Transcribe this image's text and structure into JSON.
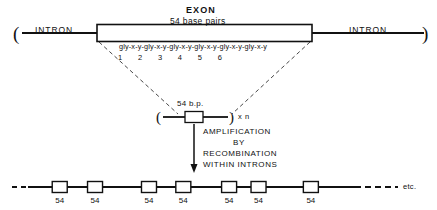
{
  "figure": {
    "top_row": {
      "left_intron_label": "INTRON",
      "right_intron_label": "INTRON",
      "exon_title": "EXON",
      "exon_subtitle": "54 base pairs",
      "left_paren": "(",
      "right_paren": ")"
    },
    "sequence": {
      "text": "gly-x-y-gly-x-y-gly-x-y-gly-x-y-gly-x-y-gly-x-y",
      "repeat_unit": "gly-x-y",
      "repeat_count": 6,
      "numbers": [
        "1",
        "2",
        "3",
        "4",
        "5",
        "6"
      ]
    },
    "unit": {
      "size_label": "54 b.p.",
      "left_paren": "(",
      "right_paren": ")",
      "multiplier": "x n"
    },
    "process": {
      "line1": "AMPLIFICATION",
      "line2": "BY",
      "line3": "RECOMBINATION",
      "line4": "WITHIN INTRONS"
    },
    "bottom_row": {
      "box_labels": [
        "54",
        "54",
        "54",
        "54",
        "54",
        "54",
        "54"
      ],
      "box_x": [
        97,
        205,
        370,
        475,
        615,
        705,
        865
      ],
      "etc_label": "etc."
    },
    "colors": {
      "ink": "#111111",
      "background": "#ffffff"
    }
  }
}
